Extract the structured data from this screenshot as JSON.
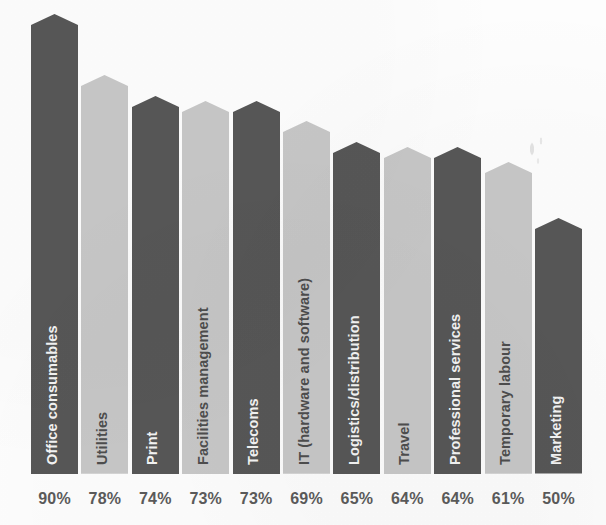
{
  "chart_data": {
    "type": "bar",
    "title": "",
    "subtitle": "",
    "xlabel": "",
    "ylabel": "",
    "ylim": [
      0,
      100
    ],
    "grid": false,
    "legend": "none",
    "orientation": "vertical",
    "value_suffix": "%",
    "categories": [
      "Office consumables",
      "Utilities",
      "Print",
      "Facilities management",
      "Telecoms",
      "IT (hardware and software)",
      "Logistics/distribution",
      "Travel",
      "Professional services",
      "Temporary labour",
      "Marketing"
    ],
    "values": [
      90,
      78,
      74,
      73,
      73,
      69,
      65,
      64,
      64,
      61,
      50
    ],
    "value_labels": [
      "90%",
      "78%",
      "74%",
      "73%",
      "73%",
      "69%",
      "65%",
      "64%",
      "64%",
      "61%",
      "50%"
    ],
    "bar_colors": [
      "#575757",
      "#c7c7c7",
      "#575757",
      "#c7c7c7",
      "#575757",
      "#c7c7c7",
      "#575757",
      "#c7c7c7",
      "#575757",
      "#c7c7c7",
      "#575757"
    ],
    "bar_label_colors": [
      "#f4f4f4",
      "#4e4e4e",
      "#f4f4f4",
      "#4e4e4e",
      "#f4f4f4",
      "#4e4e4e",
      "#f4f4f4",
      "#4e4e4e",
      "#f4f4f4",
      "#4e4e4e",
      "#f4f4f4"
    ]
  },
  "style": {
    "background": "#fdfdfd",
    "dark_bar": "#575757",
    "light_bar": "#c7c7c7",
    "value_text": "#5b5b5b",
    "label_on_dark": "#f4f4f4",
    "label_on_light": "#4e4e4e"
  }
}
